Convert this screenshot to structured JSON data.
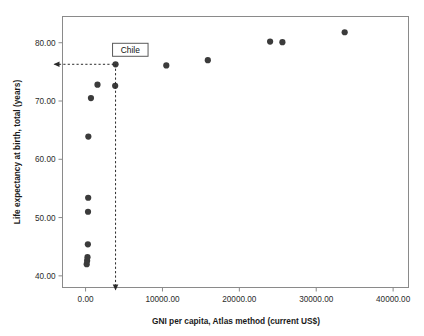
{
  "chart_data": {
    "type": "scatter",
    "title": "",
    "xlabel": "GNI per capita, Atlas method (current US$)",
    "ylabel": "Life expectancy at birth, total (years)",
    "xlim": [
      -3000,
      42000
    ],
    "ylim": [
      38.0,
      84.5
    ],
    "grid": false,
    "legend": null,
    "xticks": [
      0,
      10000,
      20000,
      30000,
      40000
    ],
    "xtick_labels": [
      "0.00",
      "10000.00",
      "20000.00",
      "30000.00",
      "40000.00"
    ],
    "yticks": [
      40,
      50,
      60,
      70,
      80
    ],
    "ytick_labels": [
      "40.00",
      "50.00",
      "60.00",
      "70.00",
      "80.00"
    ],
    "marker_color": "#3b3b3b",
    "points": [
      {
        "x": 150,
        "y": 42.0
      },
      {
        "x": 200,
        "y": 42.6
      },
      {
        "x": 250,
        "y": 43.2
      },
      {
        "x": 300,
        "y": 45.4
      },
      {
        "x": 320,
        "y": 51.0
      },
      {
        "x": 340,
        "y": 53.4
      },
      {
        "x": 360,
        "y": 63.9
      },
      {
        "x": 700,
        "y": 70.5
      },
      {
        "x": 1550,
        "y": 72.8
      },
      {
        "x": 3850,
        "y": 72.6
      },
      {
        "x": 3900,
        "y": 76.3
      },
      {
        "x": 10500,
        "y": 76.1
      },
      {
        "x": 15900,
        "y": 77.0
      },
      {
        "x": 24000,
        "y": 80.2
      },
      {
        "x": 25600,
        "y": 80.1
      },
      {
        "x": 33700,
        "y": 81.8
      }
    ],
    "annotation": {
      "label": "Chile",
      "x": 3900,
      "y": 76.3,
      "guide_x_value": 3900,
      "guide_y_value": 76.3
    }
  }
}
